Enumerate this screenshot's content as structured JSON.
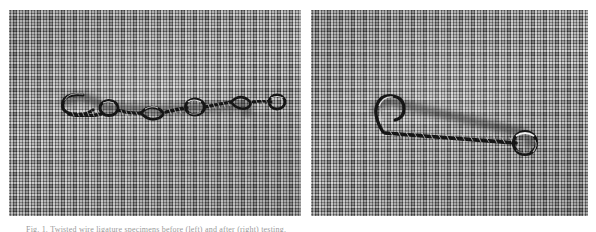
{
  "figure": {
    "name": "wire-specimen-comparison-figure",
    "background_color": "#ffffff",
    "caption": "Fig. 1. Twisted wire ligature specimens before (left) and after (right) testing.",
    "panels": [
      {
        "id": "left",
        "label": "",
        "subject": "twisted wire ligature with multiple open loops",
        "background": "woven fabric cloth, grayscale",
        "cloth_color": "#8a8a8a",
        "wire_color": "#1d1d1d",
        "highlight_color": "#f2f2f2",
        "loop_count": "5"
      },
      {
        "id": "right",
        "label": "",
        "subject": "twisted wire ligature with hooked end and single terminal loop",
        "background": "woven fabric cloth, grayscale",
        "cloth_color": "#8a8a8a",
        "wire_color": "#1d1d1d",
        "highlight_color": "#f2f2f2",
        "loop_count": "1"
      }
    ]
  }
}
